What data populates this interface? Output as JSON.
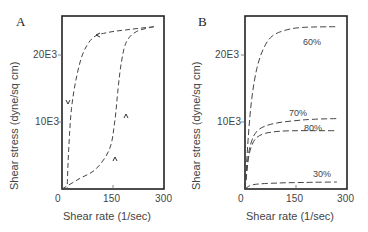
{
  "chart_data": [
    {
      "type": "line",
      "panel": "A",
      "title": "",
      "xlabel": "Shear rate (1/sec)",
      "ylabel": "Shear stress (dyne/sq cm)",
      "xlim": [
        0,
        300
      ],
      "ylim": [
        0,
        25800
      ],
      "xticks": [
        "0",
        "150",
        "300"
      ],
      "yticks": [
        "10E3",
        "20E3"
      ],
      "grid": false,
      "annotations": [
        "arrows indicate direction: up-curve then down-curve (hysteresis loop)"
      ],
      "series": [
        {
          "name": "increasing shear rate",
          "x": [
            0,
            50,
            100,
            140,
            155,
            165,
            175,
            190,
            220,
            270
          ],
          "y": [
            0,
            1500,
            3000,
            6000,
            10000,
            15000,
            19000,
            22000,
            23500,
            24200
          ]
        },
        {
          "name": "decreasing shear rate",
          "x": [
            270,
            200,
            130,
            90,
            60,
            40,
            28,
            22,
            18,
            15
          ],
          "y": [
            24200,
            23800,
            23300,
            22500,
            20000,
            16000,
            12000,
            8000,
            4000,
            0
          ]
        }
      ]
    },
    {
      "type": "line",
      "panel": "B",
      "title": "",
      "xlabel": "Shear rate (1/sec)",
      "ylabel": "Shear stress (dyne/sq cm)",
      "xlim": [
        0,
        300
      ],
      "ylim": [
        0,
        25800
      ],
      "xticks": [
        "0",
        "150",
        "300"
      ],
      "yticks": [
        "10E3",
        "20E3"
      ],
      "grid": false,
      "series": [
        {
          "name": "60%",
          "x": [
            0,
            10,
            20,
            35,
            55,
            80,
            120,
            170,
            270
          ],
          "y": [
            0,
            8000,
            13500,
            18000,
            21000,
            22800,
            23700,
            24100,
            24200
          ]
        },
        {
          "name": "70%",
          "x": [
            0,
            10,
            20,
            35,
            60,
            100,
            150,
            200,
            270
          ],
          "y": [
            0,
            5000,
            7200,
            8600,
            9400,
            9900,
            10200,
            10400,
            10500
          ]
        },
        {
          "name": "80%",
          "x": [
            0,
            10,
            20,
            35,
            60,
            100,
            150,
            200,
            270
          ],
          "y": [
            0,
            4500,
            6500,
            7700,
            8300,
            8600,
            8700,
            8700,
            8700
          ]
        },
        {
          "name": "30%",
          "x": [
            0,
            15,
            40,
            100,
            150,
            200,
            270
          ],
          "y": [
            0,
            500,
            750,
            900,
            950,
            1000,
            1050
          ]
        }
      ]
    }
  ],
  "panels": {
    "a": {
      "letter": "A",
      "ytick_20": "20E3",
      "ytick_10": "10E3",
      "xtick_0": "0",
      "xtick_150": "150",
      "xtick_300": "300",
      "xlabel": "Shear rate (1/sec)",
      "ylabel": "Shear stress (dyne/sq cm)"
    },
    "b": {
      "letter": "B",
      "ytick_20": "20E3",
      "ytick_10": "10E3",
      "xtick_0": "0",
      "xtick_150": "150",
      "xtick_300": "300",
      "xlabel": "Shear rate (1/sec)",
      "ylabel": "Shear stress (dyne/sq cm)",
      "labels": {
        "s60": "60%",
        "s70": "70%",
        "s80": "80%",
        "s30": "30%"
      }
    }
  }
}
